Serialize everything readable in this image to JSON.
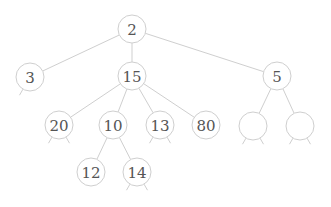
{
  "diagram": {
    "type": "tree",
    "node_radius": 14,
    "colors": {
      "stroke": "#cfcfcf",
      "text": "#555555",
      "background": "#ffffff"
    },
    "nodes": [
      {
        "id": "n2",
        "label": "2",
        "x": 132,
        "y": 29,
        "stubs": false
      },
      {
        "id": "n3",
        "label": "3",
        "x": 30,
        "y": 77,
        "stubs": "left"
      },
      {
        "id": "n15",
        "label": "15",
        "x": 132,
        "y": 76,
        "stubs": false
      },
      {
        "id": "n5",
        "label": "5",
        "x": 277,
        "y": 76,
        "stubs": false
      },
      {
        "id": "n20",
        "label": "20",
        "x": 59,
        "y": 125,
        "stubs": "both"
      },
      {
        "id": "n10",
        "label": "10",
        "x": 113,
        "y": 125,
        "stubs": false
      },
      {
        "id": "n13",
        "label": "13",
        "x": 160,
        "y": 125,
        "stubs": "both"
      },
      {
        "id": "n80",
        "label": "80",
        "x": 206,
        "y": 125,
        "stubs": false
      },
      {
        "id": "e1",
        "label": "",
        "x": 253,
        "y": 126,
        "stubs": "both"
      },
      {
        "id": "e2",
        "label": "",
        "x": 300,
        "y": 126,
        "stubs": "both"
      },
      {
        "id": "n12",
        "label": "12",
        "x": 91,
        "y": 172,
        "stubs": false
      },
      {
        "id": "n14",
        "label": "14",
        "x": 137,
        "y": 172,
        "stubs": "both"
      }
    ],
    "edges": [
      [
        "n2",
        "n3"
      ],
      [
        "n2",
        "n15"
      ],
      [
        "n2",
        "n5"
      ],
      [
        "n15",
        "n20"
      ],
      [
        "n15",
        "n10"
      ],
      [
        "n15",
        "n13"
      ],
      [
        "n15",
        "n80"
      ],
      [
        "n5",
        "e1"
      ],
      [
        "n5",
        "e2"
      ],
      [
        "n10",
        "n12"
      ],
      [
        "n10",
        "n14"
      ]
    ]
  }
}
